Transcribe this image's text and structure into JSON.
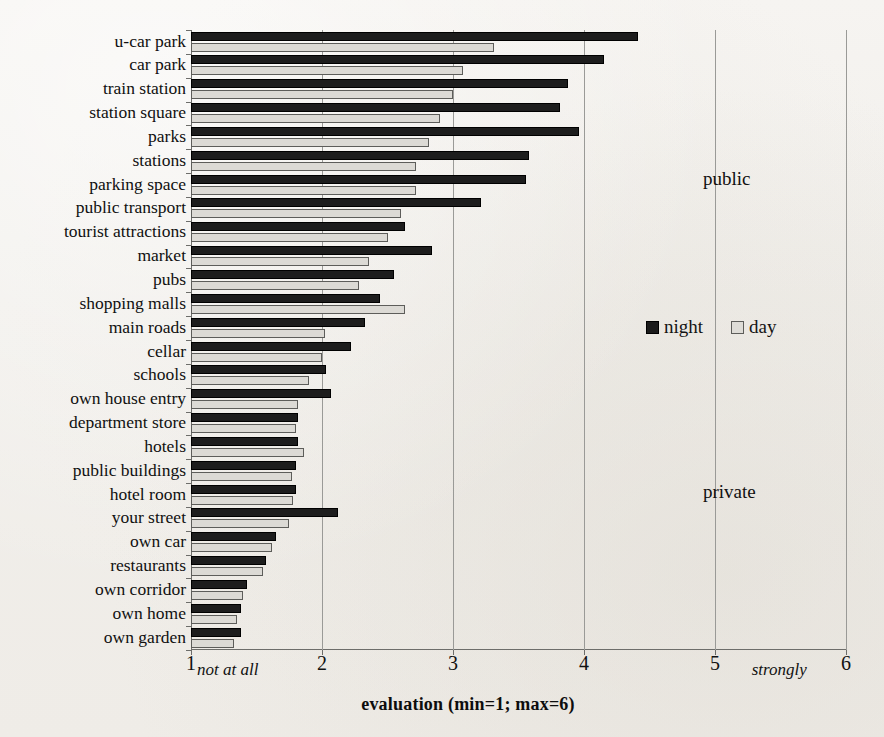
{
  "chart_data": {
    "type": "bar",
    "orientation": "horizontal",
    "title": "",
    "xlabel": "evaluation (min=1; max=6)",
    "ylabel": "",
    "xlim": [
      1,
      6
    ],
    "xticks": [
      1,
      2,
      3,
      4,
      5,
      6
    ],
    "grid": "vertical",
    "legend_position": "right-middle",
    "axis_end_labels": {
      "left": "not at all",
      "right": "strongly"
    },
    "annotations": [
      {
        "text": "public",
        "position": "upper-right"
      },
      {
        "text": "private",
        "position": "lower-right"
      }
    ],
    "categories": [
      "u-car park",
      "car park",
      "train station",
      "station square",
      "parks",
      "stations",
      "parking space",
      "public transport",
      "tourist attractions",
      "market",
      "pubs",
      "shopping malls",
      "main roads",
      "cellar",
      "schools",
      "own house entry",
      "department store",
      "hotels",
      "public buildings",
      "hotel room",
      "your street",
      "own car",
      "restaurants",
      "own corridor",
      "own home",
      "own garden"
    ],
    "series": [
      {
        "name": "night",
        "color": "#1d1d1d",
        "values": [
          4.41,
          4.15,
          3.88,
          3.82,
          3.96,
          3.58,
          3.56,
          3.21,
          2.63,
          2.84,
          2.55,
          2.44,
          2.33,
          2.22,
          2.03,
          2.07,
          1.82,
          1.82,
          1.8,
          1.8,
          2.12,
          1.65,
          1.57,
          1.43,
          1.38,
          1.38
        ]
      },
      {
        "name": "day",
        "color": "#dcdad5",
        "values": [
          3.31,
          3.08,
          3.0,
          2.9,
          2.82,
          2.72,
          2.72,
          2.6,
          2.5,
          2.36,
          2.28,
          2.63,
          2.02,
          2.0,
          1.9,
          1.82,
          1.8,
          1.86,
          1.77,
          1.78,
          1.75,
          1.62,
          1.55,
          1.4,
          1.35,
          1.33
        ]
      }
    ]
  },
  "legend": {
    "night_label": "night",
    "day_label": "day"
  },
  "axis": {
    "title": "evaluation (min=1; max=6)",
    "left_anchor": "not at all",
    "right_anchor": "strongly"
  },
  "zones": {
    "public": "public",
    "private": "private"
  }
}
